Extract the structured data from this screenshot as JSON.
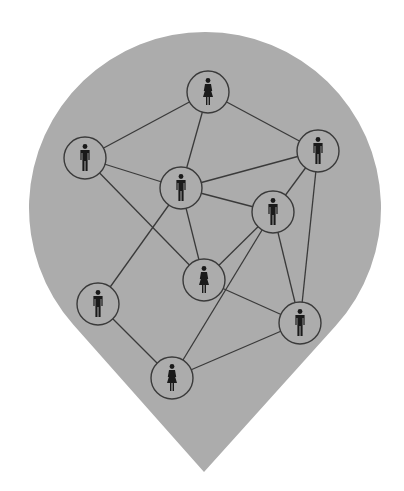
{
  "diagram": {
    "title": "",
    "shape": "map-pin",
    "colors": {
      "background": "#ffffff",
      "pin_fill": "#acacac",
      "line": "#3a3a3a",
      "node_stroke": "#3a3a3a",
      "icon": "#1a1a1a"
    },
    "pin": {
      "cx": 205,
      "cy": 208,
      "r": 176,
      "tip_x": 204,
      "tip_y": 472
    },
    "node_radius": 21,
    "nodes": [
      {
        "id": "A",
        "type": "female",
        "x": 208,
        "y": 92
      },
      {
        "id": "B",
        "type": "male",
        "x": 85,
        "y": 158
      },
      {
        "id": "C",
        "type": "male",
        "x": 181,
        "y": 188
      },
      {
        "id": "D",
        "type": "male",
        "x": 318,
        "y": 151
      },
      {
        "id": "E",
        "type": "male",
        "x": 273,
        "y": 212
      },
      {
        "id": "F",
        "type": "female",
        "x": 204,
        "y": 280
      },
      {
        "id": "G",
        "type": "male",
        "x": 98,
        "y": 304
      },
      {
        "id": "H",
        "type": "male",
        "x": 300,
        "y": 323
      },
      {
        "id": "I",
        "type": "female",
        "x": 172,
        "y": 378
      }
    ],
    "edges": [
      [
        "A",
        "B"
      ],
      [
        "A",
        "C"
      ],
      [
        "A",
        "D"
      ],
      [
        "B",
        "C"
      ],
      [
        "B",
        "F"
      ],
      [
        "C",
        "D"
      ],
      [
        "C",
        "E"
      ],
      [
        "C",
        "F"
      ],
      [
        "C",
        "G"
      ],
      [
        "D",
        "E"
      ],
      [
        "D",
        "H"
      ],
      [
        "E",
        "F"
      ],
      [
        "E",
        "I"
      ],
      [
        "E",
        "H"
      ],
      [
        "F",
        "H"
      ],
      [
        "G",
        "I"
      ],
      [
        "I",
        "H"
      ]
    ]
  }
}
